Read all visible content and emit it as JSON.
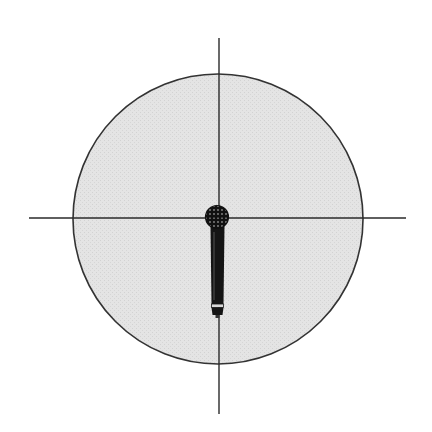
{
  "diagram": {
    "title": "Omnidirectional microphone pickup pattern",
    "pattern": "omnidirectional",
    "colors": {
      "background": "#ffffff",
      "pickup_fill": "#e4e4e4",
      "outline": "#333333",
      "axis": "#2a2a2a",
      "mic_body": "#151515",
      "mic_band": "#d8d8d8"
    },
    "pickup_circle": {
      "cx": 218,
      "cy": 219,
      "r": 145
    },
    "axes": {
      "horizontal": {
        "x1": 29,
        "x2": 406,
        "y": 218
      },
      "vertical": {
        "x": 219,
        "y1": 38,
        "y2": 414
      }
    },
    "microphone": {
      "icon": "handheld-microphone-icon",
      "orientation": "pointing up",
      "head": {
        "cx": 217,
        "cy": 217,
        "r": 11
      }
    }
  }
}
